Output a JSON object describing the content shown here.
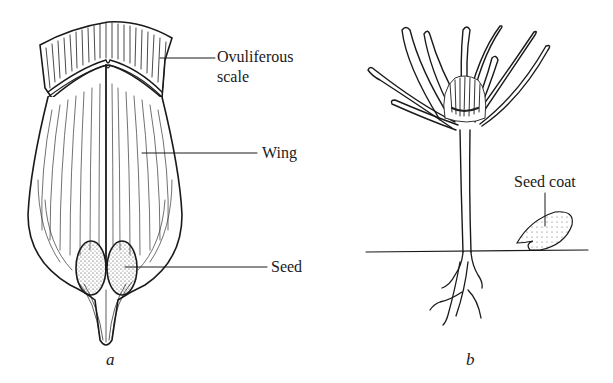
{
  "figure": {
    "panel_a": {
      "caption": "a",
      "subject": "winged seed on ovuliferous scale",
      "labels": {
        "ovuliferous_scale_line1": "Ovuliferous",
        "ovuliferous_scale_line2": "scale",
        "wing": "Wing",
        "seed": "Seed"
      }
    },
    "panel_b": {
      "caption": "b",
      "subject": "germinating seedling with seed coat",
      "labels": {
        "seed_coat": "Seed coat"
      }
    }
  }
}
